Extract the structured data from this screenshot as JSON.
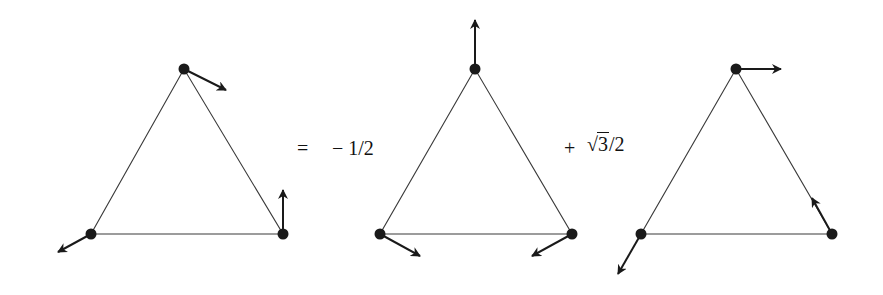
{
  "diagram": {
    "type": "vector-field-decomposition-on-triangles",
    "colors": {
      "edge": "#3a3a3a",
      "vertex": "#1a1a1a",
      "text": "#111111",
      "background": "#ffffff"
    },
    "triangles": [
      {
        "id": "lhs",
        "vertices": [
          [
            184,
            69
          ],
          [
            91,
            234
          ],
          [
            283,
            234
          ]
        ],
        "vectors": [
          {
            "from": [
              184,
              69
            ],
            "to": [
              226,
              90
            ]
          },
          {
            "from": [
              91,
              234
            ],
            "to": [
              58,
              252
            ]
          },
          {
            "from": [
              283,
              234
            ],
            "to": [
              283,
              190
            ]
          }
        ]
      },
      {
        "id": "term1",
        "vertices": [
          [
            475,
            69
          ],
          [
            380,
            234
          ],
          [
            572,
            234
          ]
        ],
        "vectors": [
          {
            "from": [
              475,
              69
            ],
            "to": [
              475,
              20
            ]
          },
          {
            "from": [
              380,
              234
            ],
            "to": [
              420,
              256
            ]
          },
          {
            "from": [
              572,
              234
            ],
            "to": [
              532,
              256
            ]
          }
        ]
      },
      {
        "id": "term2",
        "vertices": [
          [
            736,
            69
          ],
          [
            641,
            234
          ],
          [
            832,
            234
          ]
        ],
        "vectors": [
          {
            "from": [
              736,
              69
            ],
            "to": [
              781,
              69
            ]
          },
          {
            "from": [
              641,
              234
            ],
            "to": [
              618,
              274
            ]
          },
          {
            "from": [
              832,
              234
            ],
            "to": [
              812,
              198
            ]
          }
        ]
      }
    ]
  },
  "equation": {
    "equals": "=",
    "coef1_sign": "−",
    "coef1_value": "1/2",
    "plus": "+",
    "sqrt_symbol": "√",
    "sqrt_radicand": "3",
    "coef2_denominator": "/2"
  }
}
